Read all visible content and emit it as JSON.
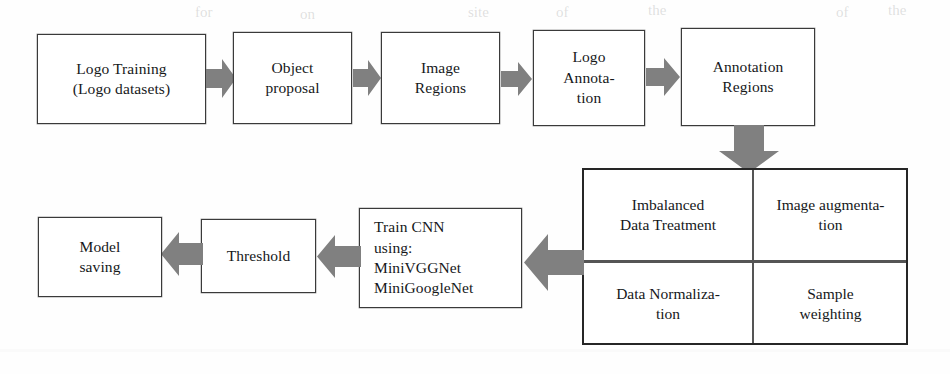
{
  "figure": {
    "arrow_color": "#808080",
    "box_border_color": "#3a3a3a",
    "panel_border_color": "#262626",
    "background_color": "#ffffff"
  },
  "nodes": {
    "logo_training": {
      "lines": [
        "Logo Training",
        "(Logo datasets)"
      ]
    },
    "object_proposal": {
      "lines": [
        "Object",
        "proposal"
      ]
    },
    "image_regions": {
      "lines": [
        "Image",
        "Regions"
      ]
    },
    "logo_annotation": {
      "lines": [
        "Logo",
        "Annota-",
        "tion"
      ]
    },
    "annotation_regions": {
      "lines": [
        "Annotation",
        "Regions"
      ]
    },
    "train_cnn": {
      "lines": [
        "Train CNN",
        "using:",
        "MiniVGGNet",
        "MiniGoogleNet"
      ]
    },
    "threshold": {
      "lines": [
        "Threshold"
      ]
    },
    "model_saving": {
      "lines": [
        "Model",
        "saving"
      ]
    }
  },
  "panel": {
    "cells": {
      "imbalanced_data_treatment": {
        "lines": [
          "Imbalanced",
          "Data Treatment"
        ]
      },
      "image_augmentation": {
        "lines": [
          "Image augmenta-",
          "tion"
        ]
      },
      "data_normalization": {
        "lines": [
          "Data Normaliza-",
          "tion"
        ]
      },
      "sample_weighting": {
        "lines": [
          "Sample",
          "weighting"
        ]
      }
    }
  },
  "arrows": [
    {
      "name": "arrow-logo-training-to-object-proposal",
      "direction": "right"
    },
    {
      "name": "arrow-object-proposal-to-image-regions",
      "direction": "right"
    },
    {
      "name": "arrow-image-regions-to-logo-annotation",
      "direction": "right"
    },
    {
      "name": "arrow-logo-annotation-to-annotation-regions",
      "direction": "right"
    },
    {
      "name": "arrow-annotation-regions-to-panel",
      "direction": "down"
    },
    {
      "name": "arrow-panel-to-train-cnn",
      "direction": "left"
    },
    {
      "name": "arrow-train-cnn-to-threshold",
      "direction": "left"
    },
    {
      "name": "arrow-threshold-to-model-saving",
      "direction": "left"
    }
  ],
  "ghosts": [
    {
      "text": "the",
      "x": 652,
      "y": 6
    },
    {
      "text": "of",
      "x": 560,
      "y": 8
    },
    {
      "text": "site",
      "x": 470,
      "y": 8
    },
    {
      "text": "on",
      "x": 300,
      "y": 10
    },
    {
      "text": "for",
      "x": 195,
      "y": 9
    },
    {
      "text": "of",
      "x": 840,
      "y": 8
    },
    {
      "text": "the",
      "x": 893,
      "y": 5
    }
  ]
}
